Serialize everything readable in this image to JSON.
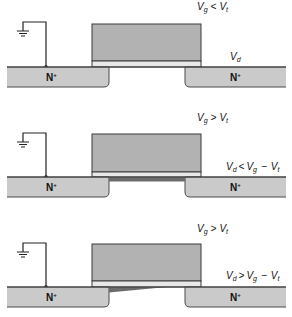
{
  "figure": {
    "panels": [
      {
        "gate_condition": {
          "v1": "V",
          "s1": "g",
          "op": "<",
          "v2": "V",
          "s2": "t"
        },
        "drain_condition": {
          "v1": "V",
          "s1": "d"
        },
        "source_region": {
          "main": "N",
          "sup": "+"
        },
        "drain_region": {
          "main": "N",
          "sup": "+"
        },
        "channel_state": "none"
      },
      {
        "gate_condition": {
          "v1": "V",
          "s1": "g",
          "op": ">",
          "v2": "V",
          "s2": "t"
        },
        "drain_condition": {
          "v1": "V",
          "s1": "d",
          "op1": "<",
          "v2": "V",
          "s2": "g",
          "op2": "−",
          "v3": "V",
          "s3": "t"
        },
        "source_region": {
          "main": "N",
          "sup": "+"
        },
        "drain_region": {
          "main": "N",
          "sup": "+"
        },
        "channel_state": "uniform"
      },
      {
        "gate_condition": {
          "v1": "V",
          "s1": "g",
          "op": ">",
          "v2": "V",
          "s2": "t"
        },
        "drain_condition": {
          "v1": "V",
          "s1": "d",
          "op1": ">",
          "v2": "V",
          "s2": "g",
          "op2": "−",
          "v3": "V",
          "s3": "t"
        },
        "source_region": {
          "main": "N",
          "sup": "+"
        },
        "drain_region": {
          "main": "N",
          "sup": "+"
        },
        "channel_state": "pinched-off"
      }
    ],
    "colors": {
      "gate": "#b2b2b2",
      "oxide": "#e8e8e8",
      "n_plus": "#cacaca",
      "channel": "#6c6c6c"
    }
  }
}
